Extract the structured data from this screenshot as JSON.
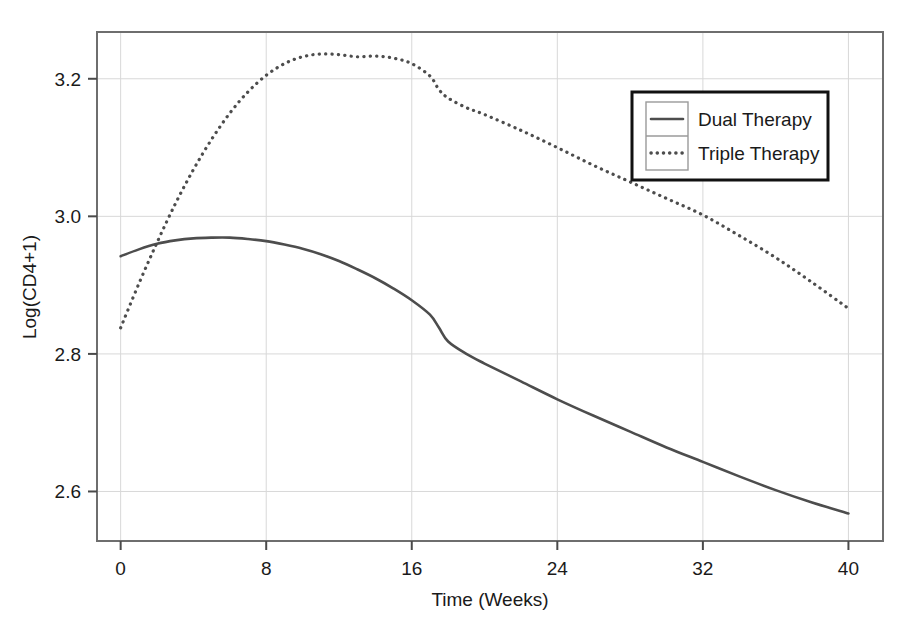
{
  "chart_data": {
    "type": "line",
    "title": "",
    "subtitle": "",
    "xlabel": "Time (Weeks)",
    "ylabel": "Log(CD4+1)",
    "xlim": [
      -1.3,
      41.9
    ],
    "ylim": [
      2.528,
      3.268
    ],
    "xticks": [
      0,
      8,
      16,
      24,
      32,
      40
    ],
    "xticklabels": [
      "0",
      "8",
      "16",
      "24",
      "32",
      "40"
    ],
    "yticks": [
      2.6,
      2.8,
      3.0,
      3.2
    ],
    "yticklabels": [
      "2.6",
      "2.8",
      "3.0",
      "3.2"
    ],
    "grid": true,
    "grid_color": "#d8d8d8",
    "axis_color": "#5a5a5a",
    "legend": {
      "position": "top-right",
      "border": true,
      "entries": [
        {
          "label": "Dual Therapy",
          "style": "solid",
          "color": "#4d4d4d"
        },
        {
          "label": "Triple Therapy",
          "style": "dotted",
          "color": "#4d4d4d"
        }
      ]
    },
    "x": [
      0,
      1,
      2,
      3,
      4,
      5,
      6,
      7,
      8,
      9,
      10,
      11,
      12,
      13,
      14,
      15,
      16,
      17,
      17.5,
      18,
      19,
      20,
      22,
      24,
      26,
      28,
      30,
      32,
      34,
      36,
      38,
      40
    ],
    "series": [
      {
        "name": "Dual Therapy",
        "style": "solid",
        "color": "#4d4d4d",
        "values": [
          2.942,
          2.952,
          2.96,
          2.965,
          2.968,
          2.969,
          2.969,
          2.967,
          2.964,
          2.959,
          2.953,
          2.945,
          2.935,
          2.923,
          2.91,
          2.895,
          2.878,
          2.857,
          2.838,
          2.818,
          2.8,
          2.786,
          2.76,
          2.734,
          2.71,
          2.687,
          2.664,
          2.643,
          2.622,
          2.602,
          2.584,
          2.568
        ]
      },
      {
        "name": "Triple Therapy",
        "style": "dotted",
        "color": "#4d4d4d",
        "values": [
          2.838,
          2.902,
          2.962,
          3.018,
          3.068,
          3.112,
          3.15,
          3.181,
          3.205,
          3.222,
          3.232,
          3.236,
          3.235,
          3.232,
          3.233,
          3.23,
          3.222,
          3.204,
          3.184,
          3.172,
          3.158,
          3.148,
          3.125,
          3.1,
          3.074,
          3.05,
          3.026,
          3.002,
          2.972,
          2.94,
          2.904,
          2.866
        ]
      }
    ]
  }
}
